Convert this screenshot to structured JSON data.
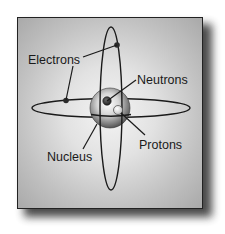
{
  "diagram": {
    "labels": {
      "electrons": "Electrons",
      "neutrons": "Neutrons",
      "protons": "Protons",
      "nucleus": "Nucleus"
    },
    "colors": {
      "line": "#1a1a1a",
      "panel_center": "#f4f4f4",
      "panel_edge": "#a9a9a9",
      "shadow": "#2a2a2a",
      "neutron": "#2b2b2b",
      "proton": "#f2f2f2"
    }
  }
}
